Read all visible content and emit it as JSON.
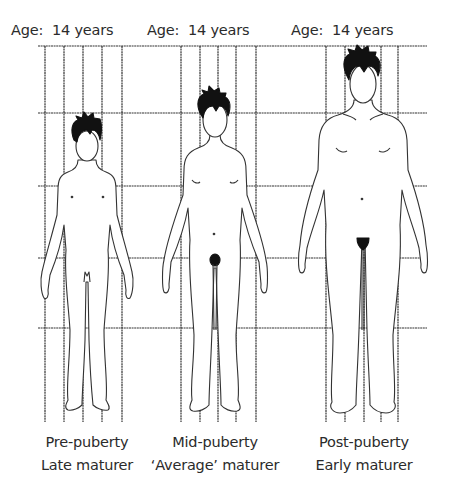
{
  "figures": [
    {
      "age_label": "Age:  14 years",
      "stage": "Pre-puberty",
      "maturity": "Late maturer"
    },
    {
      "age_label": "Age:  14 years",
      "stage": "Mid-puberty",
      "maturity": "‘Average’ maturer"
    },
    {
      "age_label": "Age:  14 years",
      "stage": "Post-puberty",
      "maturity": "Early maturer"
    }
  ],
  "colors": {
    "line": "#333333",
    "hair": "#111111",
    "text": "#2b2b2b"
  }
}
